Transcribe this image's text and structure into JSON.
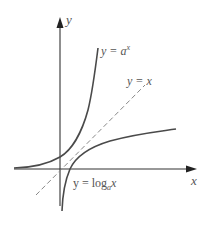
{
  "figure": {
    "title": "",
    "axes": {
      "x_label": "x",
      "y_label": "y"
    },
    "curves": [
      {
        "id": "exponential",
        "label_prefix": "y = ",
        "label_base": "a",
        "label_exp": "x",
        "style": "solid"
      },
      {
        "id": "identity",
        "label": "y = x",
        "style": "dashed"
      },
      {
        "id": "logarithm",
        "label_prefix": "y = log",
        "label_sub": "a",
        "label_arg": "x",
        "style": "solid"
      }
    ],
    "colors": {
      "axis": "#222222",
      "curve": "#4a4a4a",
      "dashed": "#888888",
      "text": "#555555"
    }
  }
}
